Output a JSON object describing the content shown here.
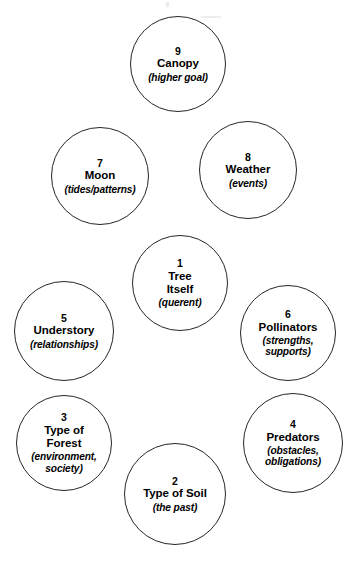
{
  "diagram": {
    "background_color": "#ffffff",
    "stroke_color": "#262626",
    "text_color": "#000000",
    "nodes": [
      {
        "id": "canopy",
        "number": "9",
        "title": "Canopy",
        "subtitle": "(higher goal)",
        "cx": 178,
        "cy": 64,
        "r": 48
      },
      {
        "id": "moon",
        "number": "7",
        "title": "Moon",
        "subtitle": "(tides/patterns)",
        "cx": 100,
        "cy": 176,
        "r": 49
      },
      {
        "id": "weather",
        "number": "8",
        "title": "Weather",
        "subtitle": "(events)",
        "cx": 248,
        "cy": 170,
        "r": 49
      },
      {
        "id": "tree-itself",
        "number": "1",
        "title": "Tree\nItself",
        "subtitle": "(querent)",
        "cx": 180,
        "cy": 283,
        "r": 48
      },
      {
        "id": "understory",
        "number": "5",
        "title": "Understory",
        "subtitle": "(relationships)",
        "cx": 64,
        "cy": 331,
        "r": 50
      },
      {
        "id": "pollinators",
        "number": "6",
        "title": "Pollinators",
        "subtitle": "(strengths,\nsupports)",
        "cx": 288,
        "cy": 333,
        "r": 48
      },
      {
        "id": "type-of-forest",
        "number": "3",
        "title": "Type of\nForest",
        "subtitle": "(environment,\nsociety)",
        "cx": 64,
        "cy": 443,
        "r": 48
      },
      {
        "id": "predators",
        "number": "4",
        "title": "Predators",
        "subtitle": "(obstacles,\nobligations)",
        "cx": 293,
        "cy": 443,
        "r": 50
      },
      {
        "id": "type-of-soil",
        "number": "2",
        "title": "Type of Soil",
        "subtitle": "(the past)",
        "cx": 175,
        "cy": 494,
        "r": 51
      }
    ]
  }
}
